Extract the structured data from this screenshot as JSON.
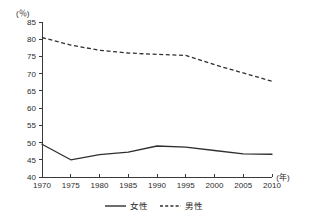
{
  "chart_data": {
    "type": "line",
    "title": "",
    "xlabel": "(年)",
    "ylabel": "(％)",
    "x": [
      1970,
      1975,
      1980,
      1985,
      1990,
      1995,
      2000,
      2005,
      2010
    ],
    "xticklabels": [
      "1970",
      "1975",
      "1980",
      "1985",
      "1990",
      "1995",
      "2000",
      "2005",
      "2010"
    ],
    "yticklabels": [
      "40",
      "45",
      "50",
      "55",
      "60",
      "65",
      "70",
      "75",
      "80",
      "85"
    ],
    "yticks": [
      40,
      45,
      50,
      55,
      60,
      65,
      70,
      75,
      80,
      85
    ],
    "xlim": [
      1970,
      2010
    ],
    "ylim": [
      40,
      85
    ],
    "grid": false,
    "legend_position": "bottom-center",
    "series": [
      {
        "name": "女性",
        "style": "solid",
        "color": "#2f2f2f",
        "values": [
          49.5,
          45.0,
          46.5,
          47.2,
          49.0,
          48.7,
          47.7,
          46.7,
          46.6
        ]
      },
      {
        "name": "男性",
        "style": "dashed",
        "color": "#2f2f2f",
        "values": [
          80.5,
          78.3,
          76.8,
          76.0,
          75.6,
          75.3,
          72.6,
          70.2,
          67.8
        ]
      }
    ]
  },
  "legend": {
    "items": [
      {
        "label": "女性",
        "style": "solid"
      },
      {
        "label": "男性",
        "style": "dashed"
      }
    ]
  }
}
